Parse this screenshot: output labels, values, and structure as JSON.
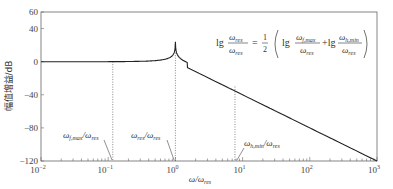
{
  "chart_data": {
    "type": "line",
    "title": "",
    "xlabel": "ω/ω_res",
    "ylabel": "幅值增益/dB",
    "xscale": "log",
    "xlim": [
      0.01,
      1000
    ],
    "ylim": [
      -120,
      60
    ],
    "xticks": [
      "10^-2",
      "10^-1",
      "10^0",
      "10^1",
      "10^2",
      "10^3"
    ],
    "yticks": [
      60,
      40,
      0,
      -40,
      -80,
      -120
    ],
    "grid": false,
    "series": [
      {
        "name": "magnitude response",
        "x": [
          0.01,
          0.05,
          0.1,
          0.3,
          0.6,
          0.85,
          0.95,
          1.0,
          1.05,
          1.2,
          2,
          5,
          7.7,
          20,
          100,
          1000
        ],
        "y": [
          0,
          0,
          0,
          0.5,
          2.5,
          8,
          20,
          52,
          20,
          6,
          -8,
          -22,
          -30,
          -45,
          -72,
          -120
        ]
      }
    ],
    "vlines": [
      {
        "x": 0.117,
        "label": "ω_f,max/ω_res",
        "style": "dotted"
      },
      {
        "x": 1.0,
        "label": "ω_res/ω_res",
        "style": "dotted"
      },
      {
        "x": 7.7,
        "label": "ω_h,min/ω_res",
        "style": "dotted"
      }
    ],
    "annotations": [
      {
        "text": "lg(ω_res/ω_res) = 1/2 ( lg(ω_f,max/ω_res) + lg(ω_h,min/ω_res) )",
        "position": "upper-right"
      }
    ]
  },
  "axes": {
    "ylabel": "幅值增益/dB",
    "xlabel_main": "ω/ω",
    "xlabel_sub": "res",
    "yticks": [
      {
        "label": "60",
        "v": 60
      },
      {
        "label": "40",
        "v": 40
      },
      {
        "label": "0",
        "v": 0
      },
      {
        "label": "-40",
        "v": -40
      },
      {
        "label": "-80",
        "v": -80
      },
      {
        "label": "-120",
        "v": -120
      }
    ],
    "xticks": [
      {
        "base": "10",
        "exp": "-2"
      },
      {
        "base": "10",
        "exp": "-1"
      },
      {
        "base": "10",
        "exp": "0"
      },
      {
        "base": "10",
        "exp": "1"
      },
      {
        "base": "10",
        "exp": "2"
      },
      {
        "base": "10",
        "exp": "3"
      }
    ]
  },
  "labels": {
    "fmax": {
      "w": "ω",
      "sub1": "f,max",
      "slash": "/ω",
      "sub2": "res"
    },
    "res": {
      "w": "ω",
      "sub1": "res",
      "slash": "/ω",
      "sub2": "res"
    },
    "hmin": {
      "w": "ω",
      "sub1": "h,min",
      "slash": "/ω",
      "sub2": "res"
    }
  },
  "equation": {
    "lg": "lg",
    "num": "ω",
    "num_sub": "res",
    "den": "ω",
    "den_sub": "res",
    "eq": "=",
    "half_num": "1",
    "half_den": "2",
    "t1_num_sub": "f,max",
    "t2_num_sub": "h,min",
    "plus": "+lg"
  }
}
